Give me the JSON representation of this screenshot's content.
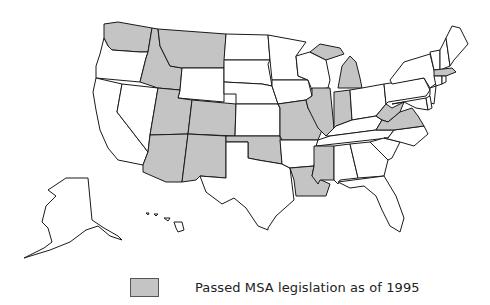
{
  "map": {
    "title": "United States map of MSA legislation",
    "colors": {
      "passed": "#c4c4c4",
      "not_passed": "#ffffff",
      "border": "#1a1a1a"
    },
    "states_passed": [
      "WA",
      "ID",
      "MT",
      "UT",
      "CO",
      "AZ",
      "NM",
      "OK",
      "MO",
      "IL",
      "IN",
      "MI",
      "MS",
      "LA",
      "WV",
      "VA",
      "MA"
    ],
    "states_not_passed": [
      "OR",
      "CA",
      "NV",
      "WY",
      "ND",
      "SD",
      "NE",
      "KS",
      "TX",
      "MN",
      "IA",
      "AR",
      "WI",
      "KY",
      "TN",
      "AL",
      "GA",
      "FL",
      "SC",
      "NC",
      "OH",
      "PA",
      "NY",
      "NJ",
      "DE",
      "MD",
      "CT",
      "RI",
      "VT",
      "NH",
      "ME",
      "AK",
      "HI"
    ]
  },
  "legend": {
    "items": [
      {
        "label": "Passed MSA legislation as of 1995",
        "color": "#c4c4c4"
      }
    ]
  }
}
